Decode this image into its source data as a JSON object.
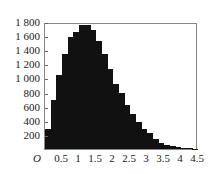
{
  "chart_data": {
    "type": "bar",
    "title": "",
    "xlabel": "",
    "ylabel": "",
    "xlim": [
      0,
      4.5
    ],
    "ylim": [
      0,
      1800
    ],
    "grid": false,
    "legend": null,
    "bin_width": 0.1667,
    "origin_label": "O",
    "x_ticks": [
      "0.5",
      "1",
      "1.5",
      "2",
      "2.5",
      "3",
      "3.5",
      "4",
      "4.5"
    ],
    "x_tick_values": [
      0.5,
      1,
      1.5,
      2,
      2.5,
      3,
      3.5,
      4,
      4.5
    ],
    "y_ticks": [
      "200",
      "400",
      "600",
      "800",
      "1 000",
      "1 200",
      "1 400",
      "1 600",
      "1 800"
    ],
    "y_tick_values": [
      200,
      400,
      600,
      800,
      1000,
      1200,
      1400,
      1600,
      1800
    ],
    "categories": [
      "0.00",
      "0.17",
      "0.33",
      "0.50",
      "0.67",
      "0.83",
      "1.00",
      "1.17",
      "1.33",
      "1.50",
      "1.67",
      "1.83",
      "2.00",
      "2.17",
      "2.33",
      "2.50",
      "2.67",
      "2.83",
      "3.00",
      "3.17",
      "3.33",
      "3.50",
      "3.67",
      "3.83",
      "4.00",
      "4.17",
      "4.33"
    ],
    "values": [
      280,
      690,
      1050,
      1350,
      1590,
      1660,
      1760,
      1760,
      1690,
      1530,
      1340,
      1140,
      920,
      800,
      630,
      490,
      380,
      290,
      220,
      140,
      90,
      60,
      40,
      25,
      15,
      10,
      5
    ]
  },
  "colors": {
    "bar": "#111111",
    "axis": "#888888",
    "background": "#ffffff"
  }
}
